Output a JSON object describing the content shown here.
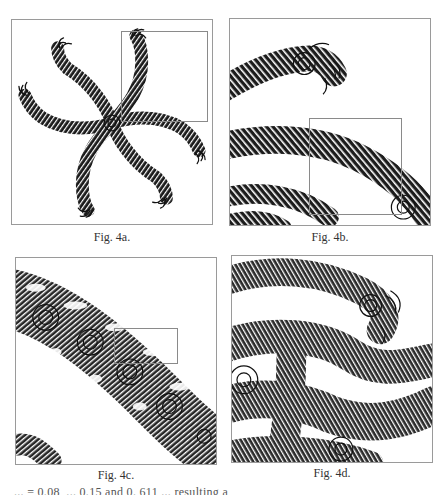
{
  "figures": [
    {
      "id": "4a",
      "caption": "Fig. 4a.",
      "description": "Six-armed spiral fractal, full view",
      "frame": {
        "x": 11,
        "y": 19,
        "w": 202,
        "h": 206
      },
      "zoom_box": {
        "x": 109,
        "y": 11,
        "w": 87,
        "h": 91
      }
    },
    {
      "id": "4b",
      "caption": "Fig. 4b.",
      "description": "Magnified region of Fig. 4a showing braided spiral arms",
      "frame": {
        "x": 229,
        "y": 18,
        "w": 202,
        "h": 208
      },
      "zoom_box": {
        "x": 79,
        "y": 99,
        "w": 93,
        "h": 97
      }
    },
    {
      "id": "4c",
      "caption": "Fig. 4c.",
      "description": "Further magnification showing nested spirals along an arm",
      "frame": {
        "x": 15,
        "y": 257,
        "w": 202,
        "h": 208
      },
      "zoom_box": {
        "x": 98,
        "y": 70,
        "w": 64,
        "h": 36
      }
    },
    {
      "id": "4d",
      "caption": "Fig. 4d.",
      "description": "Deepest magnification with dense self-similar spiral structure",
      "frame": {
        "x": 231,
        "y": 255,
        "w": 202,
        "h": 208
      }
    }
  ],
  "footer_text_partial": "... = 0.08, ... 0.15 and 0. 611 ... resulting a"
}
